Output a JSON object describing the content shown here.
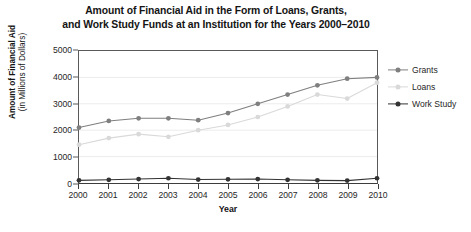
{
  "chart_data": {
    "type": "line",
    "title": "Amount of Financial Aid in the Form of Loans, Grants, and Work Study Funds at an Institution for the Years 2000–2010",
    "title_lines": [
      "Amount of Financial Aid in the Form of Loans, Grants,",
      "and Work Study Funds at an Institution for the Years 2000–2010"
    ],
    "xlabel": "Year",
    "ylabel": "Amount of Financial Aid (in Millions of Dollars)",
    "ylabel_lines": [
      "Amount of Financial Aid",
      "(in Millions of Dollars)"
    ],
    "categories": [
      "2000",
      "2001",
      "2002",
      "2003",
      "2004",
      "2005",
      "2006",
      "2007",
      "2008",
      "2009",
      "2010"
    ],
    "x": [
      2000,
      2001,
      2002,
      2003,
      2004,
      2005,
      2006,
      2007,
      2008,
      2009,
      2010
    ],
    "xlim": [
      2000,
      2010
    ],
    "ylim": [
      0,
      5000
    ],
    "yticks": [
      0,
      1000,
      2000,
      3000,
      4000,
      5000
    ],
    "ytick_labels": [
      "0",
      "1000",
      "2000",
      "3000",
      "4000",
      "5000"
    ],
    "grid": true,
    "grid_axis": "y",
    "legend_position": "right",
    "series": [
      {
        "name": "Grants",
        "color": "#7f7f7f",
        "marker": "circle",
        "values": [
          2100,
          2350,
          2450,
          2450,
          2380,
          2650,
          3000,
          3350,
          3700,
          3950,
          4000
        ]
      },
      {
        "name": "Loans",
        "color": "#d9d9d9",
        "marker": "circle",
        "values": [
          1450,
          1700,
          1850,
          1750,
          2000,
          2200,
          2500,
          2900,
          3350,
          3200,
          3800
        ]
      },
      {
        "name": "Work Study",
        "color": "#333333",
        "marker": "circle",
        "values": [
          100,
          120,
          150,
          180,
          130,
          140,
          150,
          120,
          100,
          90,
          180
        ]
      }
    ]
  }
}
